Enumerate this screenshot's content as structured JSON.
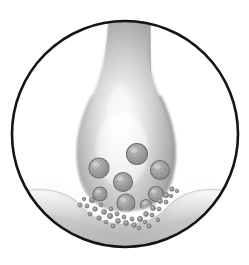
{
  "figure": {
    "title": "Chemical synapse cross-section",
    "domain": "biological-illustration",
    "style": "grayscale airbrush rendering inside circular frame",
    "background_color": "#ffffff",
    "outline_color": "#111111",
    "canvas": {
      "width": 249,
      "height": 265
    }
  },
  "frame": {
    "name": "circular-border",
    "shape": "circle",
    "center_x": 125,
    "center_y": 134,
    "radius": 114,
    "stroke_color": "#141414",
    "stroke_width": 2.6,
    "fill": "none"
  },
  "structures": {
    "axon": {
      "label": "axon-stalk",
      "description": "tubular presynaptic axon descending from top of frame",
      "top_y": 18,
      "left_x": 108,
      "right_x": 152,
      "fill_light": "#f2f2f2",
      "fill_mid": "#c9c9c9",
      "fill_dark": "#a6a6a6"
    },
    "terminal": {
      "label": "axon-terminal-bouton",
      "description": "bulbous presynaptic terminal containing synaptic vesicles",
      "center_x": 126,
      "center_y": 140,
      "width": 100,
      "height": 130,
      "fill_light": "#fbfbfb",
      "fill_mid": "#c4c4c4",
      "fill_dark": "#9b9b9b",
      "edge_shadow": "#8e8e8e"
    },
    "cleft": {
      "label": "synaptic-cleft",
      "description": "light gap between presynaptic terminal and postsynaptic membrane",
      "fill": "#fdfdfd"
    },
    "dendrite": {
      "label": "postsynaptic-dendrite-membrane",
      "description": "curved postsynaptic membrane band spanning the lower circle",
      "crest_left_y": 170,
      "trough_y": 212,
      "crest_right_y": 170,
      "fill_light": "#f4f4f4",
      "fill_mid": "#c0c0c0",
      "fill_dark": "#9d9d9d"
    }
  },
  "vesicles": {
    "label": "synaptic-vesicles",
    "fill": "#a9a9a9",
    "stroke": "#6e6e6e",
    "texture": "granular speckle",
    "count": 8,
    "items": [
      {
        "id": "vesicle-1",
        "cx": 137,
        "cy": 154,
        "r": 10.5
      },
      {
        "id": "vesicle-2",
        "cx": 99,
        "cy": 168,
        "r": 10.0
      },
      {
        "id": "vesicle-3",
        "cx": 160,
        "cy": 170,
        "r": 9.5
      },
      {
        "id": "vesicle-4",
        "cx": 123,
        "cy": 182,
        "r": 9.5
      },
      {
        "id": "vesicle-5",
        "cx": 156,
        "cy": 194,
        "r": 7.5
      },
      {
        "id": "vesicle-6",
        "cx": 100,
        "cy": 194,
        "r": 7.0
      },
      {
        "id": "vesicle-7",
        "cx": 126,
        "cy": 203,
        "r": 9.0
      },
      {
        "id": "vesicle-8",
        "cx": 146,
        "cy": 205,
        "r": 5.5
      }
    ]
  },
  "neurotransmitters": {
    "label": "neurotransmitter-particles",
    "fill": "#9a9a9a",
    "stroke": "#6a6a6a",
    "count": 34,
    "items": [
      {
        "cx": 92,
        "cy": 200,
        "r": 2.6
      },
      {
        "cx": 87,
        "cy": 206,
        "r": 2.0
      },
      {
        "cx": 95,
        "cy": 209,
        "r": 2.3
      },
      {
        "cx": 101,
        "cy": 205,
        "r": 1.8
      },
      {
        "cx": 104,
        "cy": 212,
        "r": 2.4
      },
      {
        "cx": 111,
        "cy": 209,
        "r": 1.9
      },
      {
        "cx": 110,
        "cy": 216,
        "r": 2.6
      },
      {
        "cx": 117,
        "cy": 214,
        "r": 2.0
      },
      {
        "cx": 118,
        "cy": 221,
        "r": 2.4
      },
      {
        "cx": 124,
        "cy": 217,
        "r": 1.9
      },
      {
        "cx": 126,
        "cy": 223,
        "r": 2.5
      },
      {
        "cx": 132,
        "cy": 219,
        "r": 2.0
      },
      {
        "cx": 134,
        "cy": 225,
        "r": 2.3
      },
      {
        "cx": 140,
        "cy": 219,
        "r": 2.6
      },
      {
        "cx": 145,
        "cy": 222,
        "r": 1.8
      },
      {
        "cx": 146,
        "cy": 214,
        "r": 2.4
      },
      {
        "cx": 152,
        "cy": 215,
        "r": 2.0
      },
      {
        "cx": 153,
        "cy": 208,
        "r": 2.5
      },
      {
        "cx": 159,
        "cy": 209,
        "r": 1.9
      },
      {
        "cx": 160,
        "cy": 201,
        "r": 2.4
      },
      {
        "cx": 166,
        "cy": 202,
        "r": 2.0
      },
      {
        "cx": 166,
        "cy": 195,
        "r": 2.6
      },
      {
        "cx": 171,
        "cy": 196,
        "r": 1.8
      },
      {
        "cx": 172,
        "cy": 189,
        "r": 2.2
      },
      {
        "cx": 177,
        "cy": 191,
        "r": 1.7
      },
      {
        "cx": 84,
        "cy": 199,
        "r": 1.7
      },
      {
        "cx": 80,
        "cy": 205,
        "r": 2.1
      },
      {
        "cx": 90,
        "cy": 214,
        "r": 1.9
      },
      {
        "cx": 99,
        "cy": 218,
        "r": 2.2
      },
      {
        "cx": 106,
        "cy": 222,
        "r": 1.8
      },
      {
        "cx": 113,
        "cy": 226,
        "r": 2.0
      },
      {
        "cx": 139,
        "cy": 228,
        "r": 1.9
      },
      {
        "cx": 149,
        "cy": 226,
        "r": 2.1
      },
      {
        "cx": 158,
        "cy": 220,
        "r": 1.8
      }
    ]
  }
}
